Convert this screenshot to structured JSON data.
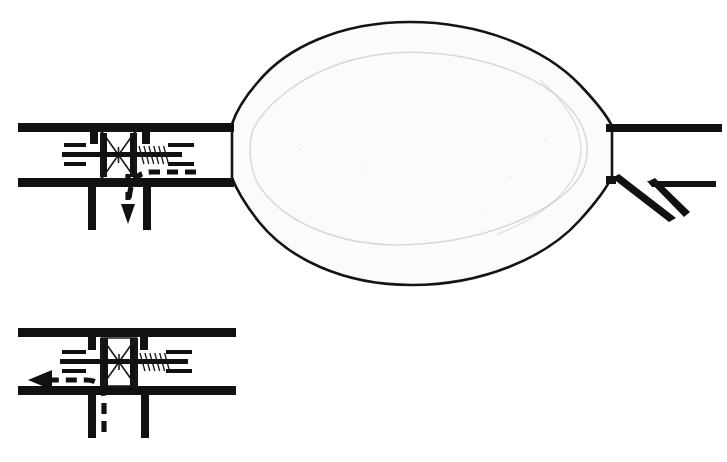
{
  "figure": {
    "title": "Airway valve with inflatable cuff — flow direction diagram",
    "background_color": "#ffffff",
    "ink_color": "#111111",
    "balloon_fill_color": "#fbfbfb",
    "balloon_shade_color": "#ededed"
  },
  "panels": [
    {
      "id": "upper-panel",
      "name": "inflated-cuff-inspiration-panel",
      "caption": "",
      "parts": [
        {
          "id": "upper-duct-wall-top",
          "label": "upper tube wall"
        },
        {
          "id": "upper-duct-wall-bottom",
          "label": "lower tube wall"
        },
        {
          "id": "upper-valve-seat-left",
          "label": "left valve seat post"
        },
        {
          "id": "upper-valve-seat-right",
          "label": "right valve seat post"
        },
        {
          "id": "upper-bowtie-valve",
          "label": "bowtie poppet valve disc"
        },
        {
          "id": "upper-valve-stem",
          "label": "valve stem / shaft"
        },
        {
          "id": "upper-valve-spring",
          "label": "return spring"
        },
        {
          "id": "upper-flow-ticks-left",
          "label": "incoming flow stream lines"
        },
        {
          "id": "upper-flow-ticks-right",
          "label": "outgoing flow stream lines"
        },
        {
          "id": "upper-flow-arrow",
          "label": "diverted flow arrow (downward)"
        },
        {
          "id": "upper-branch-left",
          "label": "left branch wall"
        },
        {
          "id": "upper-branch-right",
          "label": "right branch wall"
        },
        {
          "id": "balloon-cuff",
          "label": "inflated balloon cuff"
        },
        {
          "id": "distal-neck",
          "label": "distal neck / connector"
        },
        {
          "id": "distal-prongs",
          "label": "distal bifurcated prongs"
        }
      ],
      "flow_arrow": {
        "name": "downward-diverted-flow",
        "direction": "down",
        "style": "dashed-with-solid-head"
      }
    },
    {
      "id": "lower-panel",
      "name": "valve-detail-expiration-panel",
      "caption": "",
      "parts": [
        {
          "id": "lower-duct-wall-top",
          "label": "upper tube wall"
        },
        {
          "id": "lower-duct-wall-bottom",
          "label": "lower tube wall"
        },
        {
          "id": "lower-valve-seat-left",
          "label": "left valve seat post"
        },
        {
          "id": "lower-valve-seat-right",
          "label": "right valve seat post"
        },
        {
          "id": "lower-bowtie-valve",
          "label": "bowtie poppet valve disc"
        },
        {
          "id": "lower-valve-stem",
          "label": "valve stem / shaft"
        },
        {
          "id": "lower-valve-spring",
          "label": "return spring"
        },
        {
          "id": "lower-flow-ticks-left",
          "label": "outgoing flow stream lines"
        },
        {
          "id": "lower-flow-ticks-right",
          "label": "incoming flow stream lines"
        },
        {
          "id": "lower-flow-arrow",
          "label": "diverted flow arrow (leftward)"
        },
        {
          "id": "lower-branch-left",
          "label": "left branch wall"
        },
        {
          "id": "lower-branch-right",
          "label": "right branch wall"
        }
      ],
      "flow_arrow": {
        "name": "leftward-diverted-flow",
        "direction": "left",
        "style": "dashed-with-solid-head"
      }
    }
  ],
  "labels": {
    "none_visible": ""
  }
}
